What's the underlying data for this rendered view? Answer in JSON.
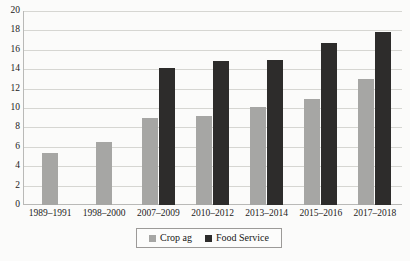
{
  "chart_data": {
    "type": "bar",
    "title": "",
    "subtitle": "",
    "xlabel": "",
    "ylabel": "",
    "ylim": [
      0,
      20
    ],
    "ytick_step": 2,
    "grid": true,
    "legend_position": "bottom",
    "categories": [
      "1989–1991",
      "1998–2000",
      "2007–2009",
      "2010–2012",
      "2013–2014",
      "2015–2016",
      "2017–2018"
    ],
    "ytick_labels": [
      "0",
      "2",
      "4",
      "6",
      "8",
      "10",
      "12",
      "14",
      "16",
      "18",
      "20"
    ],
    "ytick_values": [
      0,
      2,
      4,
      6,
      8,
      10,
      12,
      14,
      16,
      18,
      20
    ],
    "series": [
      {
        "name": "Crop ag",
        "color": "#a6a6a4",
        "values": [
          5.4,
          6.5,
          9.0,
          9.2,
          10.1,
          10.9,
          13.0
        ]
      },
      {
        "name": "Food Service",
        "color": "#2d2c2b",
        "values": [
          null,
          null,
          14.1,
          14.8,
          15.0,
          16.7,
          17.8
        ]
      }
    ]
  },
  "legend": {
    "entries": [
      {
        "label": "Crop ag",
        "color": "#a6a6a4"
      },
      {
        "label": "Food Service",
        "color": "#2d2c2b"
      }
    ]
  }
}
